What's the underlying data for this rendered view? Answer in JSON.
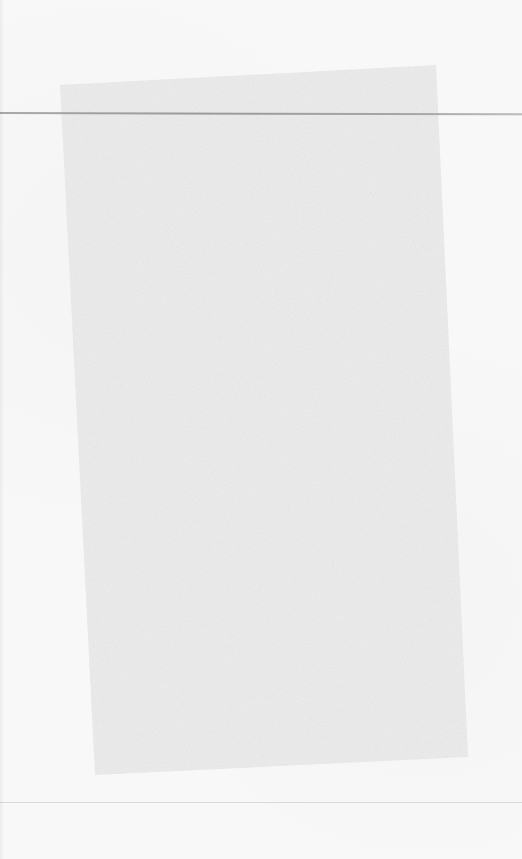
{
  "document": {
    "type": "scanned-blank-page",
    "text": "",
    "colors": {
      "background": "#f8f8f8",
      "inner_sheet": "#ececec",
      "top_rule": "#909090",
      "bottom_rule": "#cfcfcf"
    }
  }
}
